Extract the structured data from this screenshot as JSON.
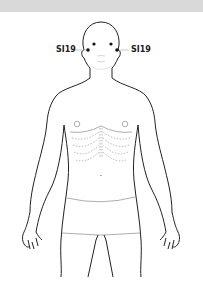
{
  "diagram": {
    "type": "acupuncture-point-body-chart",
    "view": "front",
    "point_labels": {
      "left": "SI19",
      "right": "SI19"
    },
    "colors": {
      "outline": "#222222",
      "detail": "#999999",
      "point": "#111111",
      "top_band": "#d9d9d9"
    }
  }
}
